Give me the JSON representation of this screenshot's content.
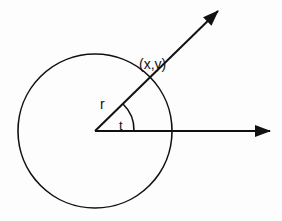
{
  "diagram": {
    "labels": {
      "point": "(x,y)",
      "radius": "r",
      "angle": "t"
    },
    "geometry": {
      "origin": [
        95,
        131
      ],
      "circle_radius": 77,
      "ray_arrow_tip": [
        218,
        11
      ],
      "axis_arrow_tip": [
        270,
        131
      ]
    },
    "colors": {
      "stroke": "#111111",
      "background": "#fdfdfd"
    }
  }
}
